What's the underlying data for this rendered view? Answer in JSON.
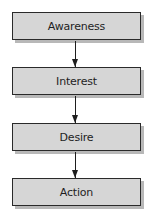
{
  "diagram": {
    "type": "flowchart",
    "direction": "top-to-bottom",
    "stages": [
      {
        "label": "Awareness"
      },
      {
        "label": "Interest"
      },
      {
        "label": "Desire"
      },
      {
        "label": "Action"
      }
    ],
    "colors": {
      "box_fill": "#d6d6d6",
      "box_border": "#2a2a2a",
      "shadow": "#b8b8b8",
      "arrow": "#1e1e1e"
    }
  }
}
